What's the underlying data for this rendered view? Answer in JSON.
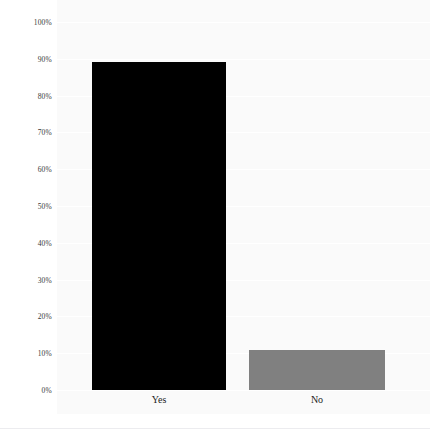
{
  "chart_data": {
    "type": "bar",
    "title": "",
    "subtitle": "",
    "xlabel": "",
    "ylabel": "",
    "categories": [
      "Yes",
      "No"
    ],
    "values": [
      89,
      11
    ],
    "value_labels": [
      "89%",
      "11%"
    ],
    "series": [
      {
        "name": "Response share",
        "values": [
          89,
          11
        ],
        "colors": [
          "#000000",
          "#808080"
        ]
      }
    ],
    "ylim": [
      0,
      100
    ],
    "y_tick_values": [
      0,
      10,
      20,
      30,
      40,
      50,
      60,
      70,
      80,
      90,
      100
    ],
    "y_tick_labels": [
      "0%",
      "10%",
      "20%",
      "30%",
      "40%",
      "50%",
      "60%",
      "70%",
      "80%",
      "90%",
      "100%"
    ],
    "grid": true,
    "grid_axis": "y",
    "legend": false,
    "legend_position": "none",
    "annotations": [],
    "bar_colors": {
      "yes": "#000000",
      "no": "#808080"
    },
    "plot_background": "#fafafa",
    "figure_background": "#ffffff",
    "gridline_color": "#ffffff",
    "tick_label_color": "#3a3a3a",
    "category_label_color": "#1c1c1c"
  },
  "bars": [
    {
      "key": "yes",
      "label": "Yes",
      "value": 89,
      "color": "#000000"
    },
    {
      "key": "no",
      "label": "No",
      "value": 11,
      "color": "#808080"
    }
  ],
  "y_ticks": [
    {
      "label": "100%",
      "value": 100
    },
    {
      "label": "90%",
      "value": 90
    },
    {
      "label": "80%",
      "value": 80
    },
    {
      "label": "70%",
      "value": 70
    },
    {
      "label": "60%",
      "value": 60
    },
    {
      "label": "50%",
      "value": 50
    },
    {
      "label": "40%",
      "value": 40
    },
    {
      "label": "30%",
      "value": 30
    },
    {
      "label": "20%",
      "value": 20
    },
    {
      "label": "10%",
      "value": 10
    },
    {
      "label": "0%",
      "value": 0
    }
  ]
}
